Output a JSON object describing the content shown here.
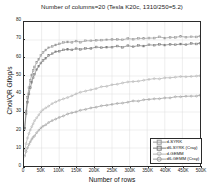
{
  "chart_data": {
    "type": "line",
    "title": "Number of columns=20 (Tesla K20c, 1310/250=5.2)",
    "xlabel": "Number of rows",
    "ylabel": "Chol/QR Gflop/s",
    "xlim": [
      0,
      500000
    ],
    "ylim": [
      0,
      80
    ],
    "grid": true,
    "legend_position": "lower right",
    "xticks": [
      0,
      50000,
      100000,
      150000,
      200000,
      250000,
      300000,
      350000,
      400000,
      450000,
      500000
    ],
    "xticklabels": [
      "0",
      "50K",
      "100K",
      "150K",
      "200K",
      "250K",
      "300K",
      "350K",
      "400K",
      "450K",
      "500K"
    ],
    "yticks": [
      0,
      10,
      20,
      30,
      40,
      50,
      60,
      70,
      80
    ],
    "yticklabels": [
      "0",
      "10",
      "20",
      "30",
      "40",
      "50",
      "60",
      "70",
      "80"
    ],
    "series": [
      {
        "name": "d-SYRK",
        "color": "#9a9a9a",
        "marker": "square",
        "x": [
          2000,
          6000,
          10000,
          14000,
          18000,
          22000,
          26000,
          30000,
          36000,
          42000,
          48000,
          54000,
          62000,
          70000,
          80000,
          90000,
          100000,
          112000,
          124000,
          136000,
          148000,
          160000,
          175000,
          190000,
          205000,
          220000,
          235000,
          250000,
          265000,
          280000,
          295000,
          310000,
          325000,
          340000,
          355000,
          370000,
          385000,
          400000,
          415000,
          430000,
          445000,
          460000,
          475000,
          490000,
          500000
        ],
        "y": [
          21.0,
          30.5,
          38.0,
          43.5,
          47.5,
          50.5,
          53.0,
          55.0,
          57.5,
          59.5,
          61.5,
          63.0,
          64.5,
          65.5,
          66.5,
          67.3,
          68.0,
          68.3,
          68.8,
          68.5,
          69.2,
          69.0,
          69.5,
          69.3,
          70.0,
          69.8,
          70.3,
          70.0,
          70.5,
          70.2,
          70.8,
          70.5,
          71.0,
          70.8,
          71.3,
          71.0,
          71.5,
          71.2,
          71.6,
          71.3,
          71.8,
          71.5,
          72.0,
          71.7,
          72.0
        ]
      },
      {
        "name": "d6-SYRK (Cray)",
        "color": "#7d7d7d",
        "marker": "square",
        "x": [
          2000,
          6000,
          10000,
          14000,
          18000,
          22000,
          26000,
          30000,
          36000,
          42000,
          48000,
          54000,
          62000,
          70000,
          80000,
          90000,
          100000,
          112000,
          124000,
          136000,
          148000,
          160000,
          175000,
          190000,
          205000,
          220000,
          235000,
          250000,
          265000,
          280000,
          295000,
          310000,
          325000,
          340000,
          355000,
          370000,
          385000,
          400000,
          415000,
          430000,
          445000,
          460000,
          475000,
          490000,
          500000
        ],
        "y": [
          21.0,
          29.0,
          35.5,
          40.0,
          43.5,
          46.5,
          49.0,
          51.0,
          53.5,
          55.5,
          57.0,
          58.5,
          60.0,
          61.2,
          62.3,
          63.2,
          63.8,
          64.3,
          64.8,
          64.5,
          65.2,
          65.0,
          65.5,
          65.3,
          65.9,
          65.7,
          66.2,
          66.0,
          66.5,
          66.2,
          66.8,
          66.5,
          67.0,
          66.8,
          67.2,
          67.0,
          67.4,
          67.2,
          67.6,
          67.4,
          67.8,
          67.6,
          68.0,
          67.8,
          68.0
        ]
      },
      {
        "name": "d-GEMM",
        "color": "#b5b5b5",
        "marker": "circle",
        "x": [
          2000,
          6000,
          10000,
          14000,
          18000,
          22000,
          26000,
          30000,
          36000,
          42000,
          48000,
          54000,
          62000,
          70000,
          80000,
          90000,
          100000,
          112000,
          124000,
          136000,
          148000,
          160000,
          175000,
          190000,
          205000,
          220000,
          235000,
          250000,
          265000,
          280000,
          295000,
          310000,
          325000,
          340000,
          355000,
          370000,
          385000,
          400000,
          415000,
          430000,
          445000,
          460000,
          475000,
          490000,
          500000
        ],
        "y": [
          8.8,
          12.5,
          15.5,
          18.0,
          20.0,
          21.8,
          23.5,
          25.0,
          27.0,
          28.5,
          30.0,
          31.2,
          32.5,
          33.5,
          34.8,
          35.6,
          36.5,
          37.5,
          38.3,
          39.2,
          40.0,
          40.8,
          41.8,
          42.5,
          43.2,
          43.8,
          44.5,
          45.0,
          45.5,
          46.0,
          46.5,
          46.9,
          47.3,
          47.7,
          48.0,
          48.3,
          48.6,
          48.9,
          49.1,
          49.4,
          49.6,
          49.8,
          50.0,
          50.1,
          50.2
        ]
      },
      {
        "name": "d6-GEMM (Cray)",
        "color": "#9f9f9f",
        "marker": "circle",
        "x": [
          2000,
          6000,
          10000,
          14000,
          18000,
          22000,
          26000,
          30000,
          36000,
          42000,
          48000,
          54000,
          62000,
          70000,
          80000,
          90000,
          100000,
          112000,
          124000,
          136000,
          148000,
          160000,
          175000,
          190000,
          205000,
          220000,
          235000,
          250000,
          265000,
          280000,
          295000,
          310000,
          325000,
          340000,
          355000,
          370000,
          385000,
          400000,
          415000,
          430000,
          445000,
          460000,
          475000,
          490000,
          500000
        ],
        "y": [
          5.5,
          8.0,
          10.2,
          12.0,
          13.5,
          14.8,
          16.0,
          17.0,
          18.5,
          19.8,
          21.0,
          22.0,
          23.2,
          24.2,
          25.3,
          26.2,
          27.0,
          27.9,
          28.7,
          29.4,
          30.1,
          30.7,
          31.5,
          32.1,
          32.7,
          33.2,
          33.8,
          34.2,
          34.7,
          35.1,
          35.5,
          35.9,
          36.3,
          36.6,
          36.9,
          37.2,
          37.5,
          37.8,
          38.0,
          38.3,
          38.5,
          38.7,
          38.9,
          39.0,
          39.1
        ]
      }
    ]
  },
  "legend": {
    "items": [
      {
        "label": "d-SYRK"
      },
      {
        "label": "d6-SYRK (Cray)"
      },
      {
        "label": "d-GEMM"
      },
      {
        "label": "d6-GEMM (Cray)"
      }
    ]
  },
  "colors": {
    "axis": "#2b2b2b",
    "grid": "#dcdcdc",
    "background": "#ffffff",
    "text": "#1a1a1a"
  }
}
